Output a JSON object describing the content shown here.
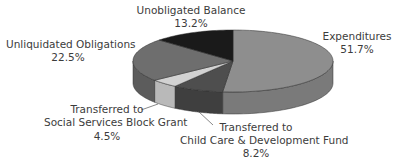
{
  "chart_data": {
    "type": "pie",
    "style": "3d-exploded-none",
    "title": "",
    "start_angle_deg": 0,
    "direction": "clockwise",
    "slices": [
      {
        "label": "Expenditures",
        "value": 51.7,
        "display": "51.7%",
        "color_top": "#8e8e8e",
        "color_side": "#7a7a7a"
      },
      {
        "label": "Transferred to Child Care & Development Fund",
        "value": 8.2,
        "display": "8.2%",
        "color_top": "#4e4e4e",
        "color_side": "#3f3f3f"
      },
      {
        "label": "Transferred to Social Services Block Grant",
        "value": 4.5,
        "display": "4.5%",
        "color_top": "#d2d2d2",
        "color_side": "#b9b9b9"
      },
      {
        "label": "Unliquidated Obligations",
        "value": 22.5,
        "display": "22.5%",
        "color_top": "#6e6e6e",
        "color_side": "#5c5c5c"
      },
      {
        "label": "Unobligated Balance",
        "value": 13.2,
        "display": "13.2%",
        "color_top": "#1a1a1a",
        "color_side": "#111111"
      }
    ],
    "legend": "none (direct labels)"
  },
  "labels": {
    "unobligated": {
      "name": "Unobligated Balance",
      "pct": "13.2%"
    },
    "expenditures": {
      "name": "Expenditures",
      "pct": "51.7%"
    },
    "unliquidated": {
      "name": "Unliquidated Obligations",
      "pct": "22.5%"
    },
    "social": {
      "line1": "Transferred to",
      "line2": "Social Services Block Grant",
      "pct": "4.5%"
    },
    "childcare": {
      "line1": "Transferred to",
      "line2": "Child Care & Development Fund",
      "pct": "8.2%"
    }
  }
}
